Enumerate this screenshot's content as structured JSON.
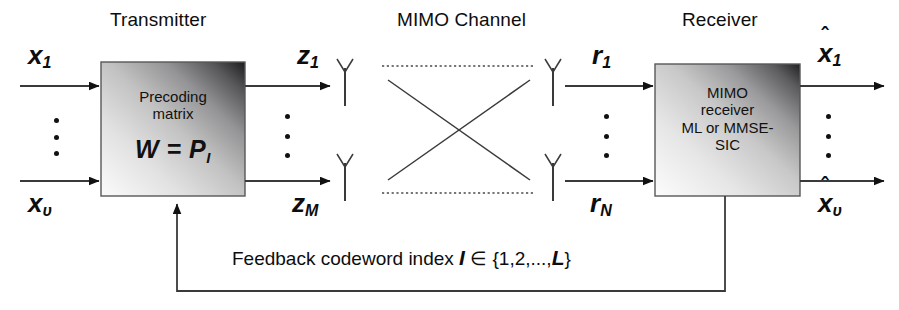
{
  "diagram": {
    "title_transmitter": "Transmitter",
    "title_channel": "MIMO Channel",
    "title_receiver": "Receiver",
    "transmitter_block": {
      "line1": "Precoding",
      "line2": "matrix",
      "formula_main": "W =  P",
      "formula_sub": "I"
    },
    "receiver_block": {
      "line1": "MIMO",
      "line2": "receiver",
      "line3": "ML or MMSE-",
      "line4": "SIC"
    },
    "inputs": [
      {
        "base": "x",
        "sub": "1"
      },
      {
        "base": "x",
        "sub": "υ"
      }
    ],
    "transmit_signals": [
      {
        "base": "z",
        "sub": "1"
      },
      {
        "base": "z",
        "sub": "M"
      }
    ],
    "receive_signals": [
      {
        "base": "r",
        "sub": "1"
      },
      {
        "base": "r",
        "sub": "N"
      }
    ],
    "outputs": [
      {
        "base": "x",
        "sub": "1",
        "hat": "ˆ"
      },
      {
        "base": "x",
        "sub": "υ",
        "hat": "ˆ"
      }
    ],
    "feedback": {
      "text": "Feedback codeword index ",
      "symbol": "I",
      "set": " ∈ {1,2,...,",
      "limit": "L",
      "close": "}"
    },
    "icons": {
      "antenna": "antenna-icon",
      "arrow": "arrow-head"
    },
    "colors": {
      "line": "#3a3a3c",
      "text": "#0d0d0d",
      "box_border": "#58585a",
      "background": "#ffffff"
    }
  }
}
